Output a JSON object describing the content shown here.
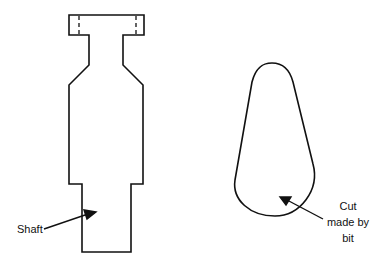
{
  "figure": {
    "left_part": {
      "name": "router bit",
      "label": "Shaft"
    },
    "right_part": {
      "name": "cut profile",
      "label_lines": [
        "Cut",
        "made by",
        "bit"
      ]
    }
  }
}
